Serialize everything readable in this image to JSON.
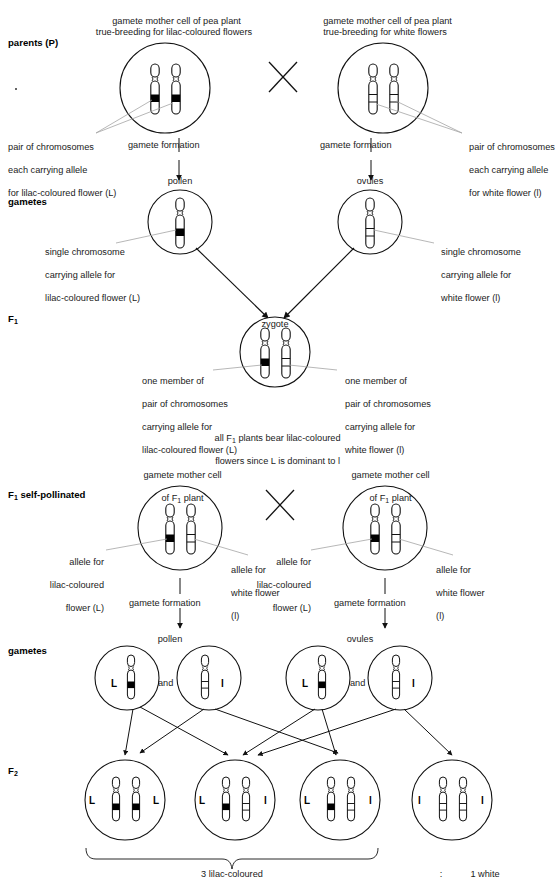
{
  "diagram": {
    "colors": {
      "ink": "#111111",
      "band": "#000000",
      "leader": "#9a9a9a",
      "paper": "#ffffff"
    }
  },
  "stage_labels": {
    "parents": "parents (P)",
    "gametes_1": "gametes",
    "f1": "F",
    "f1_sub": "1",
    "f1_self": "F",
    "f1_self_sub": "1",
    "f1_self_rest": " self-pollinated",
    "gametes_2": "gametes",
    "f2": "F",
    "f2_sub": "2"
  },
  "parents": {
    "left_caption_line1": "gamete mother cell of pea plant",
    "left_caption_line2": "true-breeding for lilac-coloured flowers",
    "right_caption_line1": "gamete mother cell of pea plant",
    "right_caption_line2": "true-breeding for white flowers",
    "cross_symbol": "✕",
    "left_annotation": [
      "pair of chromosomes",
      "each carrying allele",
      "for lilac-coloured flower (L)"
    ],
    "right_annotation": [
      "pair of chromosomes",
      "each carrying allele",
      "for white flower (l)"
    ],
    "gamete_formation_left": "gamete formation",
    "gamete_formation_right": "gamete formation"
  },
  "gametes_row1": {
    "pollen_label": "pollen",
    "ovules_label": "ovules",
    "left_annotation": [
      "single chromosome",
      "carrying allele for",
      "lilac-coloured flower (L)"
    ],
    "right_annotation": [
      "single chromosome",
      "carrying allele for",
      "white flower (l)"
    ]
  },
  "f1": {
    "zygote_label": "zygote",
    "left_annotation": [
      "one member of",
      "pair of chromosomes",
      "carrying allele for",
      "lilac-coloured flower (L)"
    ],
    "right_annotation": [
      "one member of",
      "pair of chromosomes",
      "carrying allele for",
      "white flower (l)"
    ],
    "note_line1_a": "all F",
    "note_line1_sub": "1",
    "note_line1_b": " plants bear lilac-coloured",
    "note_line2": "flowers since L is dominant to l"
  },
  "f1_self": {
    "left_caption_line1": "gamete mother cell",
    "left_caption_line2_a": "of F",
    "left_caption_line2_sub": "1",
    "left_caption_line2_b": " plant",
    "right_caption_line1": "gamete mother cell",
    "right_caption_line2_a": "of F",
    "right_caption_line2_sub": "1",
    "right_caption_line2_b": " plant",
    "cross_symbol": "✕",
    "ann_ll_lilac": [
      "allele for",
      "lilac-coloured",
      "flower (L)"
    ],
    "ann_ll_white": [
      "allele for",
      "white flower",
      "(l)"
    ],
    "ann_rr_lilac": [
      "allele for",
      "lilac-coloured",
      "flower (L)"
    ],
    "ann_rr_white": [
      "allele for",
      "white flower",
      "(l)"
    ],
    "gamete_formation_left": "gamete formation",
    "gamete_formation_right": "gamete formation"
  },
  "gametes_row2": {
    "pollen_label": "pollen",
    "ovules_label": "ovules",
    "and_left": "and",
    "and_right": "and",
    "cells": [
      {
        "allele": "L",
        "type": "dominant",
        "side": "left"
      },
      {
        "allele": "l",
        "type": "recessive",
        "side": "right"
      },
      {
        "allele": "L",
        "type": "dominant",
        "side": "left"
      },
      {
        "allele": "l",
        "type": "recessive",
        "side": "right"
      }
    ]
  },
  "f2": {
    "cells": [
      {
        "left_allele": "L",
        "right_allele": "L",
        "left_type": "dominant",
        "right_type": "dominant",
        "phenotype": "lilac-coloured"
      },
      {
        "left_allele": "L",
        "right_allele": "l",
        "left_type": "dominant",
        "right_type": "recessive",
        "phenotype": "lilac-coloured"
      },
      {
        "left_allele": "L",
        "right_allele": "l",
        "left_type": "dominant",
        "right_type": "recessive",
        "phenotype": "lilac-coloured"
      },
      {
        "left_allele": "l",
        "right_allele": "l",
        "left_type": "recessive",
        "right_type": "recessive",
        "phenotype": "white"
      }
    ],
    "ratio_left": "3 lilac-coloured",
    "ratio_separator": ":",
    "ratio_right": "1 white"
  }
}
